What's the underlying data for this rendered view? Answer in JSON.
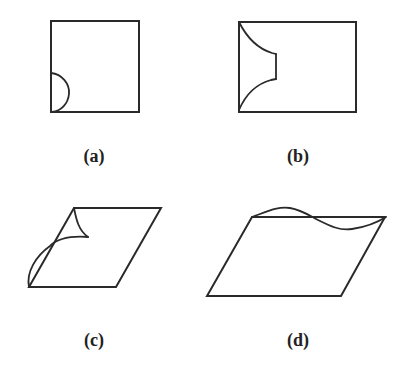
{
  "figure": {
    "stroke_color": "#2a2a2a",
    "background": "#ffffff",
    "panels": [
      {
        "id": "a",
        "label": "(a)",
        "description": "Square with a semicircular cut at the bottom-left corner on the left edge",
        "outline": "square",
        "label_pos": [
          94,
          158
        ]
      },
      {
        "id": "b",
        "label": "(b)",
        "description": "Rectangle with a concave notch region on the left side bounded by two curves",
        "outline": "rectangle",
        "label_pos": [
          298,
          158
        ]
      },
      {
        "id": "c",
        "label": "(c)",
        "description": "Parallelogram with top-left corner curled/peeled along the left edge",
        "outline": "parallelogram",
        "label_pos": [
          94,
          342
        ]
      },
      {
        "id": "d",
        "label": "(d)",
        "description": "Parallelogram with a wavy sinusoidal deformation along the top edge",
        "outline": "parallelogram",
        "label_pos": [
          298,
          342
        ]
      }
    ]
  }
}
